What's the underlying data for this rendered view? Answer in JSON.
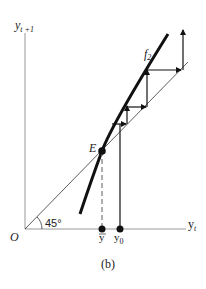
{
  "figure": {
    "caption": "(b)",
    "y_axis_label": "y",
    "y_axis_sub": "t +1",
    "x_axis_label": "y",
    "x_axis_sub": "t",
    "origin_label": "O",
    "angle_label": "45°",
    "curve_label": "f",
    "curve_sub": "2",
    "equilibrium_label": "E",
    "ybar_label": "y",
    "y0_label": "y",
    "y0_sub": "0"
  },
  "colors": {
    "line": "#111111",
    "axis": "#888888",
    "thin": "#444444"
  }
}
